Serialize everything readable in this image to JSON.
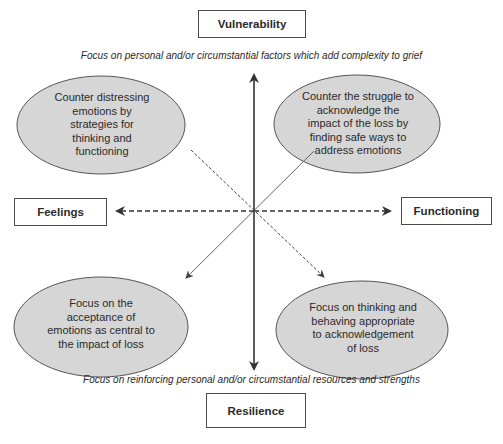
{
  "colors": {
    "ellipse_fill": "#d6d6d6",
    "ellipse_stroke": "#555555",
    "line": "#333333",
    "box_border": "#4a4a4a",
    "background": "#ffffff"
  },
  "axes": {
    "top": {
      "label": "Vulnerability",
      "caption": "Focus on personal and/or circumstantial factors which add complexity to grief"
    },
    "bottom": {
      "label": "Resilience",
      "caption": "Focus on reinforcing personal and/or circumstantial resources and strengths"
    },
    "left": {
      "label": "Feelings"
    },
    "right": {
      "label": "Functioning"
    }
  },
  "quadrants": {
    "top_left": {
      "text": "Counter distressing emotions by strategies for thinking and functioning"
    },
    "top_right": {
      "text": "Counter the struggle to acknowledge the impact of the loss by finding safe ways to address emotions"
    },
    "bottom_left": {
      "text": "Focus on the acceptance of emotions as central to the impact of loss"
    },
    "bottom_right": {
      "text": "Focus on thinking and behaving appropriate to acknowledgement of loss"
    }
  },
  "connectors": {
    "vertical": "solid double-headed arrow (Vulnerability ↔ Resilience)",
    "horizontal": "dashed double-headed arrow (Feelings ↔ Functioning)",
    "top_left_to_bottom_right": "dashed arrow",
    "top_right_to_bottom_left": "solid thin arrow"
  }
}
